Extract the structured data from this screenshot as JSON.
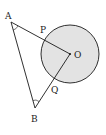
{
  "diagram": {
    "type": "geometry",
    "colors": {
      "stroke": "#1a1a1a",
      "circle_fill": "#e3e3e3",
      "background": "#ffffff"
    },
    "circle": {
      "center_label": "O",
      "cx": 70,
      "cy": 54,
      "r": 29
    },
    "points": {
      "A": {
        "label": "A",
        "x": 11,
        "y": 22,
        "lx": 5,
        "ly": 19
      },
      "B": {
        "label": "B",
        "x": 35,
        "y": 108,
        "lx": 31,
        "ly": 122
      },
      "O": {
        "label": "O",
        "x": 70,
        "y": 54,
        "lx": 74,
        "ly": 58
      },
      "P": {
        "label": "P",
        "x": 45,
        "y": 40,
        "lx": 40,
        "ly": 33
      },
      "Q": {
        "label": "Q",
        "x": 54,
        "y": 82,
        "lx": 51,
        "ly": 93
      }
    },
    "segments": [
      "AO",
      "BO",
      "AB"
    ],
    "angle_marks": [
      "A",
      "B"
    ]
  }
}
